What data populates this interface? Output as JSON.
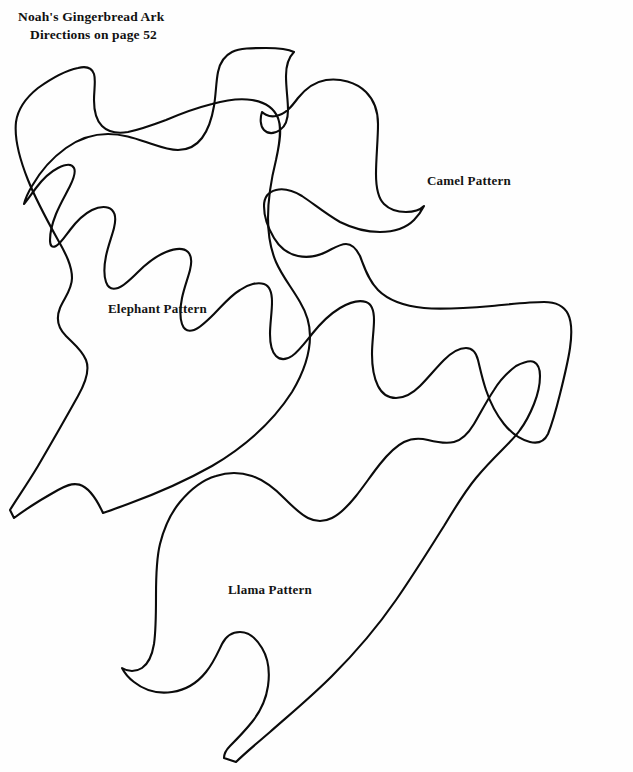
{
  "page": {
    "background_color": "#fefefe",
    "ink_color": "#0b0b0b",
    "width": 633,
    "height": 772
  },
  "heading": {
    "line1": "Noah's Gingerbread Ark",
    "line2": "Directions on page 52"
  },
  "patterns": [
    {
      "id": "elephant",
      "label": "Elephant Pattern",
      "label_x": 108,
      "label_y": 301,
      "path": "M 38 88 C 28 96 18 108 16 122 C 14 140 20 160 28 180 C 36 200 48 222 58 240 C 66 254 72 266 72 278 C 72 290 64 298 60 308 C 56 318 58 328 66 336 C 74 344 82 350 86 360 C 90 370 86 382 78 396 C 68 414 52 442 38 466 C 26 486 16 500 10 510 L 14 518 C 22 512 40 500 58 490 C 72 482 86 476 103 513 C 103 513 112 510 128 504 C 150 496 180 484 212 466 C 246 446 274 420 292 392 C 304 372 310 352 310 336 C 310 322 306 312 300 302 C 292 288 282 276 276 262 C 270 248 268 234 268 218 C 268 196 272 176 276 160 C 280 142 282 128 278 118 C 274 108 264 102 252 100 C 240 98 226 100 212 104 C 196 108 180 114 166 120 C 150 126 138 130 128 132 C 116 134 108 132 102 126 C 96 120 94 110 94 100 C 94 90 96 80 94 74 C 92 68 86 66 78 68 C 68 70 52 78 38 88 Z"
    },
    {
      "id": "camel",
      "label": "Camel Pattern",
      "label_x": 427,
      "label_y": 173,
      "path": "M 294 52 C 288 58 286 66 286 76 C 286 88 288 100 288 110 C 288 120 286 126 280 130 C 274 134 268 134 264 130 C 260 126 260 118 262 112 C 262 112 268 118 276 116 C 286 114 292 106 298 98 C 306 88 314 82 326 80 C 340 78 356 82 366 92 C 374 100 378 112 378 124 C 378 140 376 158 376 174 C 376 188 378 198 384 204 C 390 210 398 212 406 212 C 414 212 420 210 424 206 C 424 206 420 214 414 220 C 406 228 394 232 380 232 C 366 232 352 228 340 222 C 326 214 314 204 302 196 C 292 190 284 188 276 190 C 268 192 264 198 264 206 C 264 216 268 228 274 238 C 280 248 288 254 298 256 C 308 258 318 256 326 252 C 334 248 340 244 346 244 C 352 244 356 248 360 256 C 364 266 368 280 378 290 C 388 300 404 306 424 308 C 444 310 468 308 492 306 C 512 304 530 302 544 302 C 556 302 564 306 568 314 C 572 322 572 334 570 348 C 568 362 564 378 560 394 C 556 410 552 424 548 434 C 544 442 538 444 530 442 C 522 440 512 434 504 424 C 496 414 490 402 486 390 C 482 378 480 368 478 360 C 476 352 472 348 466 348 C 460 348 452 352 444 360 C 436 368 428 378 420 386 C 412 394 404 398 396 398 C 388 398 382 394 378 386 C 374 378 372 366 372 354 C 372 342 374 330 374 320 C 374 310 372 304 366 302 C 360 300 350 302 340 308 C 330 314 320 324 312 334 C 304 344 298 352 292 356 C 286 360 280 360 276 356 C 272 352 270 344 270 334 C 270 324 272 312 272 302 C 272 292 270 286 264 284 C 258 282 248 284 240 290 C 230 296 222 306 214 314 C 206 322 200 328 194 330 C 188 332 184 330 182 324 C 180 318 180 308 182 298 C 184 288 188 278 190 270 C 192 262 192 256 188 252 C 184 248 176 248 166 252 C 156 256 146 264 138 272 C 130 280 124 286 118 288 C 112 290 108 288 106 282 C 104 276 104 266 106 256 C 108 246 112 236 114 228 C 116 220 116 214 112 210 C 108 206 100 206 92 210 C 84 214 76 222 70 230 C 64 238 60 244 56 246 C 52 248 50 246 50 240 C 50 234 52 224 56 214 C 60 204 66 194 70 186 C 74 178 76 172 74 168 C 72 164 66 164 58 168 C 50 172 42 180 36 188 C 30 196 26 202 24 204 L 24 204 C 24 204 26 196 32 186 C 40 172 52 158 66 148 C 80 138 94 134 108 134 C 122 134 134 138 146 142 C 158 146 168 150 178 150 C 188 150 196 146 202 138 C 208 130 212 118 214 106 C 216 94 216 82 218 72 C 220 62 224 56 232 52 C 240 48 252 48 266 48 C 280 48 290 50 294 52 Z"
    },
    {
      "id": "llama",
      "label": "Llama Pattern",
      "label_x": 228,
      "label_y": 582,
      "path": "M 516 366 C 508 372 500 380 494 390 C 486 402 480 414 474 424 C 468 434 462 440 454 442 C 446 444 436 442 428 440 C 420 438 412 438 404 442 C 396 446 388 454 380 464 C 372 474 364 486 356 496 C 348 506 340 514 332 518 C 324 522 316 522 308 518 C 300 514 292 506 284 498 C 274 488 264 480 252 476 C 240 472 228 472 216 476 C 202 480 190 490 180 502 C 170 514 164 528 160 544 C 156 560 156 578 156 596 C 156 614 156 630 154 644 C 152 656 148 664 142 668 C 136 672 128 672 122 668 C 122 668 126 676 134 682 C 144 690 158 694 172 692 C 186 690 198 682 206 672 C 214 662 218 652 222 644 C 226 636 232 632 240 632 C 248 632 256 638 262 648 C 268 658 270 672 268 686 C 266 700 260 712 252 722 C 244 732 236 740 230 746 C 226 750 224 754 224 758 L 236 762 C 244 754 256 744 270 732 C 288 716 310 698 332 676 C 356 652 378 626 396 600 C 414 574 430 548 444 526 C 456 506 466 490 476 478 C 486 466 494 458 502 450 C 510 442 516 436 520 430 C 526 422 530 414 534 404 C 538 394 540 384 540 376 C 540 368 538 364 534 362 C 530 360 524 362 516 366 Z"
    }
  ]
}
